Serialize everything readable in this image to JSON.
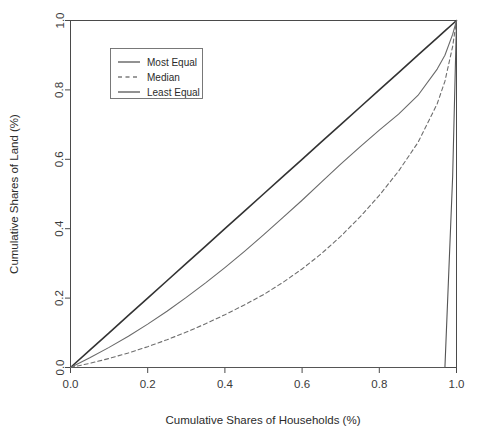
{
  "chart_data": {
    "type": "line",
    "title": "",
    "xlabel": "Cumulative Shares of Households (%)",
    "ylabel": "Cumulative Shares of Land (%)",
    "xlim": [
      0.0,
      1.0
    ],
    "ylim": [
      0.0,
      1.0
    ],
    "xticks": [
      "0.0",
      "0.2",
      "0.4",
      "0.6",
      "0.8",
      "1.0"
    ],
    "xtick_values": [
      0.0,
      0.2,
      0.4,
      0.6,
      0.8,
      1.0
    ],
    "yticks": [
      "0.0",
      "0.2",
      "0.4",
      "0.6",
      "0.8",
      "1.0"
    ],
    "ytick_values": [
      0.0,
      0.2,
      0.4,
      0.6,
      0.8,
      1.0
    ],
    "grid": false,
    "legend_position": "upper left",
    "x": [
      0.0,
      0.05,
      0.1,
      0.15,
      0.2,
      0.25,
      0.3,
      0.35,
      0.4,
      0.45,
      0.5,
      0.55,
      0.6,
      0.65,
      0.7,
      0.75,
      0.8,
      0.85,
      0.9,
      0.95,
      0.97,
      0.99,
      1.0
    ],
    "series": [
      {
        "name": "Most Equal",
        "style": "solid",
        "width": 1.6,
        "color": "#333333",
        "values": [
          0.0,
          0.05,
          0.1,
          0.15,
          0.2,
          0.25,
          0.3,
          0.35,
          0.4,
          0.45,
          0.5,
          0.55,
          0.6,
          0.65,
          0.7,
          0.75,
          0.8,
          0.85,
          0.9,
          0.95,
          0.97,
          0.99,
          1.0
        ]
      },
      {
        "name": "Median",
        "style": "dashed",
        "width": 1.1,
        "color": "#6e6e6e",
        "values": [
          0.0,
          0.012,
          0.026,
          0.042,
          0.06,
          0.08,
          0.102,
          0.126,
          0.152,
          0.18,
          0.21,
          0.245,
          0.284,
          0.328,
          0.378,
          0.434,
          0.496,
          0.566,
          0.648,
          0.76,
          0.825,
          0.925,
          1.0
        ]
      },
      {
        "name": "Least Equal",
        "style": "solid",
        "width": 1.1,
        "color": "#555555",
        "values": [
          0.0,
          0.0,
          0.0,
          0.0,
          0.0,
          0.0,
          0.0,
          0.0,
          0.0,
          0.0,
          0.0,
          0.0,
          0.0,
          0.0,
          0.0,
          0.0,
          0.0,
          0.0,
          0.0,
          0.0,
          0.0,
          0.55,
          1.0
        ]
      },
      {
        "name": "Middle Curve",
        "style": "solid",
        "width": 1.1,
        "color": "#6a6a6a",
        "values": [
          0.0,
          0.028,
          0.058,
          0.09,
          0.125,
          0.162,
          0.202,
          0.244,
          0.288,
          0.334,
          0.382,
          0.432,
          0.482,
          0.534,
          0.586,
          0.636,
          0.684,
          0.73,
          0.784,
          0.86,
          0.9,
          0.96,
          1.0
        ]
      }
    ],
    "legend": [
      {
        "label": "Most Equal",
        "style": "solid"
      },
      {
        "label": "Median",
        "style": "dashed"
      },
      {
        "label": "Least Equal",
        "style": "solid"
      }
    ]
  }
}
